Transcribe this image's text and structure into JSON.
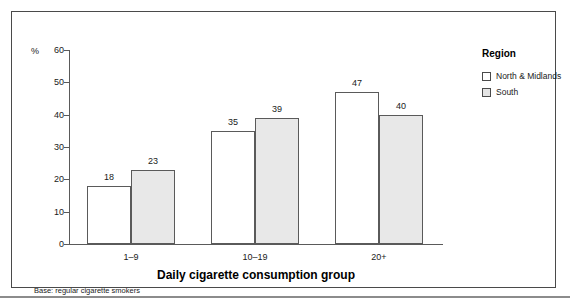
{
  "figure": {
    "footnote": "Base: regular cigarette smokers"
  },
  "legend": {
    "title": "Region",
    "items": [
      {
        "label": "North & Midlands",
        "swatch": "white-square-icon",
        "color": "#ffffff"
      },
      {
        "label": "South",
        "swatch": "grey-square-icon",
        "color": "#e4e4e4"
      }
    ]
  },
  "chart_data": {
    "type": "bar",
    "title": "",
    "xlabel": "Daily cigarette consumption group",
    "ylabel": "%",
    "categories": [
      "1–9",
      "10–19",
      "20+"
    ],
    "series": [
      {
        "name": "North & Midlands",
        "values": [
          18,
          35,
          47
        ],
        "color": "#ffffff"
      },
      {
        "name": "South",
        "values": [
          23,
          39,
          40
        ],
        "color": "#e8e8e8"
      }
    ],
    "ylim": [
      0,
      60
    ],
    "yticks": [
      0,
      10,
      20,
      30,
      40,
      50,
      60
    ],
    "ytick_labels": [
      "0",
      "10",
      "20",
      "30",
      "40",
      "50",
      "60"
    ],
    "grid": false,
    "legend_position": "right",
    "data_labels": true
  }
}
